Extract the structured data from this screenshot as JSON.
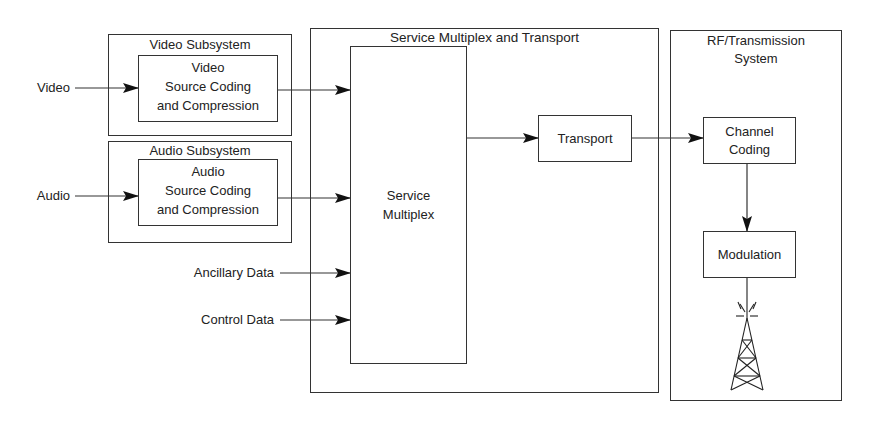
{
  "diagram": {
    "inputs": {
      "video": "Video",
      "audio": "Audio",
      "ancillary": "Ancillary Data",
      "control": "Control Data"
    },
    "video_subsystem": {
      "title": "Video Subsystem",
      "block_line1": "Video",
      "block_line2": "Source Coding",
      "block_line3": "and Compression"
    },
    "audio_subsystem": {
      "title": "Audio Subsystem",
      "block_line1": "Audio",
      "block_line2": "Source Coding",
      "block_line3": "and Compression"
    },
    "service_multiplex_transport": {
      "title": "Service Multiplex and Transport",
      "multiplex_line1": "Service",
      "multiplex_line2": "Multiplex",
      "transport": "Transport"
    },
    "rf_transmission": {
      "title_line1": "RF/Transmission",
      "title_line2": "System",
      "channel_coding_line1": "Channel",
      "channel_coding_line2": "Coding",
      "modulation": "Modulation",
      "antenna_icon": "transmission-tower-icon"
    }
  }
}
